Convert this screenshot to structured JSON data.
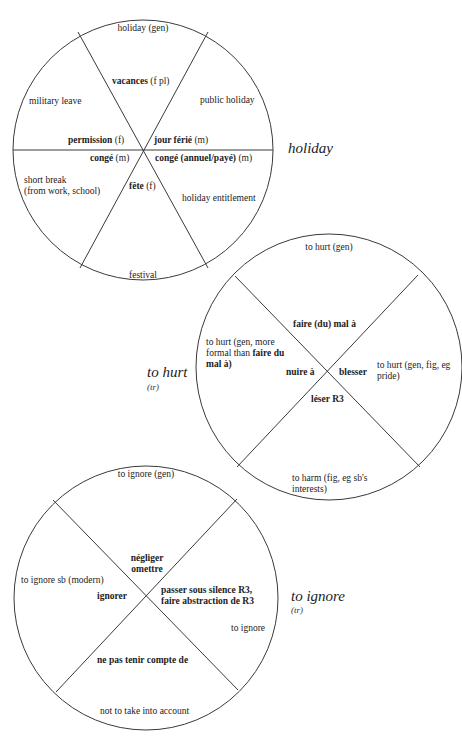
{
  "diagrams": [
    {
      "headword": "holiday",
      "grammar": "",
      "segments": {
        "top_gloss": "holiday (gen)",
        "top_term": "vacances",
        "top_term_gram": " (f pl)",
        "upper_left_gloss": "military leave",
        "upper_left_term": "permission",
        "upper_left_term_gram": " (f)",
        "upper_right_gloss": "public holiday",
        "upper_right_term": "jour férié",
        "upper_right_term_gram": " (m)",
        "lower_left_term": "congé",
        "lower_left_term_gram": " (m)",
        "lower_left_gloss_1": "short break",
        "lower_left_gloss_2": "(from work, school)",
        "lower_right_term": "congé (annuel/payé)",
        "lower_right_term_gram": " (m)",
        "lower_right_gloss": "holiday entitlement",
        "bottom_term": "fête",
        "bottom_term_gram": " (f)",
        "bottom_gloss": "festival"
      }
    },
    {
      "headword": "to hurt",
      "grammar": "(tr)",
      "segments": {
        "top_gloss": "to hurt (gen)",
        "top_term": "faire (du) mal à",
        "left_gloss_1": "to hurt (gen, more",
        "left_gloss_2a": "formal than ",
        "left_gloss_2b": "faire du",
        "left_gloss_3": "mal à)",
        "left_term": "nuire à",
        "right_term": "blesser",
        "right_gloss_1": "to hurt (gen, fig, eg",
        "right_gloss_2": "pride)",
        "bottom_term": "léser R3",
        "bottom_gloss_1": "to harm (fig, eg sb's",
        "bottom_gloss_2": "interests)"
      }
    },
    {
      "headword": "to ignore",
      "grammar": "(tr)",
      "segments": {
        "top_gloss": "to ignore (gen)",
        "top_term_1": "négliger",
        "top_term_2": "omettre",
        "left_gloss": "to ignore sb (modern)",
        "left_term": "ignorer",
        "right_term_1": "passer sous silence R3,",
        "right_term_2": "faire abstraction de R3",
        "right_gloss": "to ignore",
        "bottom_term": "ne pas tenir compte de",
        "bottom_gloss": "not to take into account"
      }
    }
  ],
  "colors": {
    "line": "#3a3a3a",
    "text": "#222222",
    "background": "#ffffff"
  }
}
